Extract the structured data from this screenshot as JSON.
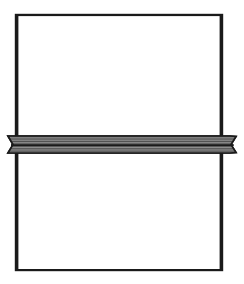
{
  "figure": {
    "type": "technical-line-drawing",
    "title": "",
    "caption": "",
    "background_color": "#ffffff",
    "stroke_color": "#1a1a1a",
    "fill_color": "#8c8c8c",
    "canvas": {
      "width": 244,
      "height": 284
    },
    "elements": {
      "outer_frame": {
        "name": "rectangular-outline",
        "shape": "rectangle",
        "x": 16,
        "y": 15,
        "width": 206,
        "height": 255,
        "stroke_width": 2.4,
        "fill": "none",
        "stroke": "#1a1a1a"
      },
      "horizontal_band": {
        "name": "hatched-horizontal-band",
        "shape": "band",
        "left": 8,
        "right": 236,
        "top": 136,
        "bottom": 153,
        "fill": "#8c8c8c",
        "stroke": "#1a1a1a",
        "stroke_width": 1.6,
        "notch_depth": 6,
        "divider_line_y": 147,
        "hatch_spacing": 1.6,
        "hatch_color": "#3d3d3d"
      }
    },
    "regions": [
      {
        "name": "upper-region",
        "label": ""
      },
      {
        "name": "lower-region",
        "label": ""
      }
    ]
  }
}
